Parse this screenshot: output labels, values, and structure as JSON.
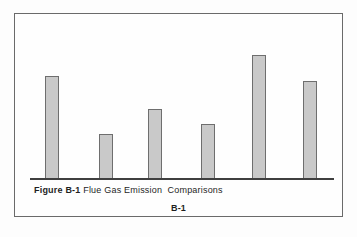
{
  "figure": {
    "label": "Figure B-1",
    "title": " Flue Gas Emission  Comparisons",
    "page_number": "B-1"
  },
  "colors": {
    "bar_fill": "#c9c9c9",
    "bar_border": "#6e6e6e",
    "axis_line": "#3f3f3f",
    "box_border": "#6a6a6a",
    "background": "#fdfdfd",
    "text": "#1f1f1f"
  },
  "chart_data": {
    "type": "bar",
    "title": "Flue Gas Emission Comparisons",
    "categories": [
      "",
      "",
      "",
      "",
      "",
      ""
    ],
    "values": [
      103,
      45,
      70,
      55,
      124,
      98
    ],
    "value_note": "no numeric axis or category labels shown; values are relative bar heights in pixels",
    "xlabel": "",
    "ylabel": "",
    "ylim": [
      0,
      165
    ],
    "grid": false,
    "legend": false
  }
}
